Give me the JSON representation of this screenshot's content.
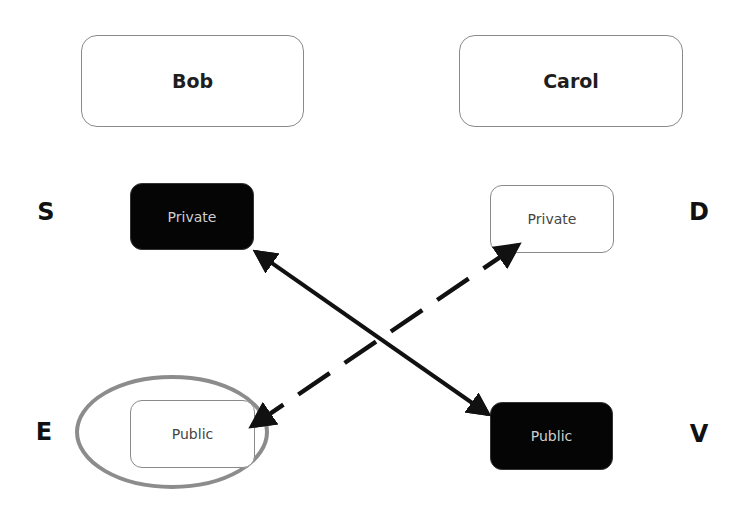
{
  "parties": {
    "left": "Bob",
    "right": "Carol"
  },
  "keys": {
    "bob_private": {
      "label": "Private",
      "style": "filled-black"
    },
    "carol_private": {
      "label": "Private",
      "style": "outlined"
    },
    "bob_public": {
      "label": "Public",
      "style": "outlined",
      "highlighted": true
    },
    "carol_public": {
      "label": "Public",
      "style": "filled-black"
    }
  },
  "letters": {
    "top_left": "S",
    "top_right": "D",
    "bottom_left": "E",
    "bottom_right": "V"
  },
  "connections": [
    {
      "from": "bob_private",
      "to": "carol_public",
      "style": "solid",
      "arrowheads": "both"
    },
    {
      "from": "bob_public",
      "to": "carol_private",
      "style": "dashed",
      "arrowheads": "both"
    }
  ],
  "colors": {
    "dark_fill": "#050505",
    "border": "#8a8a8a",
    "highlight_ellipse": "#8c8c8c",
    "arrow": "#111111"
  }
}
